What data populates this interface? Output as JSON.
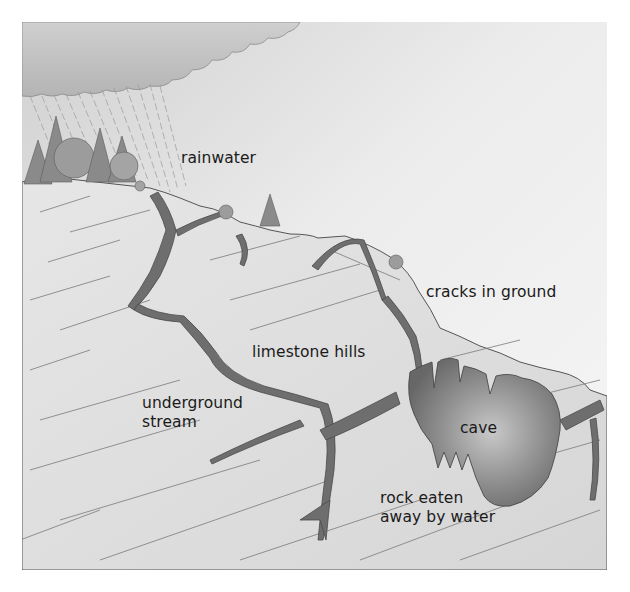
{
  "diagram": {
    "colors": {
      "sky_top": "#d2d2d2",
      "sky_bottom": "#f4f4f4",
      "cloud": "#bdbdbd",
      "rock": "#dedede",
      "rock_line": "#6a6a6a",
      "crack": "#6e6e6e",
      "cave_dark": "#6a6a6a",
      "cave_light": "#b8b8b8",
      "tree": "#8a8a8a",
      "label_text": "#1a1a1a"
    },
    "labels": {
      "rainwater": "rainwater",
      "cracks": "cracks in ground",
      "limestone": "limestone hills",
      "stream_line1": "underground",
      "stream_line2": "stream",
      "cave": "cave",
      "rock_line1": "rock eaten",
      "rock_line2": "away by water"
    }
  }
}
